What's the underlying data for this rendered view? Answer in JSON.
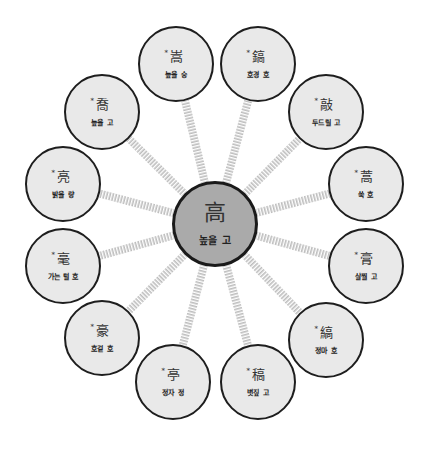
{
  "center": {
    "hanja": "高",
    "reading": "높을 고",
    "x": 215,
    "y": 224,
    "r": 43
  },
  "colors": {
    "center_fill": "#aaaaaa",
    "node_fill": "#e9e9e9",
    "border": "#1e1e1e",
    "connector": "#c8c8c8"
  },
  "nodes": [
    {
      "hanja": "嵩",
      "reading": "높을 숭",
      "x": 176,
      "y": 64
    },
    {
      "hanja": "鎬",
      "reading": "호경 호",
      "x": 258,
      "y": 64
    },
    {
      "hanja": "敲",
      "reading": "두드릴 고",
      "x": 326,
      "y": 112
    },
    {
      "hanja": "蒿",
      "reading": "쑥 호",
      "x": 366,
      "y": 184
    },
    {
      "hanja": "膏",
      "reading": "살찔 고",
      "x": 366,
      "y": 266
    },
    {
      "hanja": "縞",
      "reading": "정마 호",
      "x": 326,
      "y": 340
    },
    {
      "hanja": "稿",
      "reading": "볏짚 고",
      "x": 258,
      "y": 382
    },
    {
      "hanja": "亭",
      "reading": "정자 정",
      "x": 173,
      "y": 382
    },
    {
      "hanja": "豪",
      "reading": "호걸 호",
      "x": 102,
      "y": 338
    },
    {
      "hanja": "毫",
      "reading": "가는 털 호",
      "x": 63,
      "y": 266
    },
    {
      "hanja": "亮",
      "reading": "밝을 량",
      "x": 63,
      "y": 184
    },
    {
      "hanja": "喬",
      "reading": "높을 고",
      "x": 102,
      "y": 112
    }
  ],
  "node_radius": 38,
  "star_marker": "*"
}
